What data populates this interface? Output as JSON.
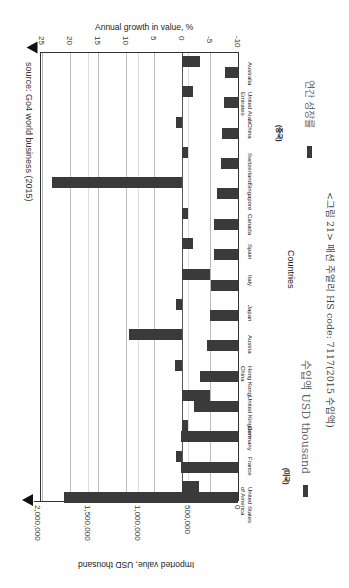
{
  "chart_data": {
    "type": "bar",
    "orientation": "rotated-90-clockwise",
    "source": "source: Go4 world business (2015)",
    "caption": "<그림 21> 패션 주얼리 HS code: 7117(2015 수입액)",
    "categories": [
      "Australia",
      "United Arab Emirates",
      "China",
      "Switzerland",
      "Singapore",
      "Canada",
      "Spain",
      "Italy",
      "Japan",
      "Austria",
      "Hong Kong, China",
      "United Kingdom",
      "Germany",
      "France",
      "United States of America"
    ],
    "category_labels": [
      "Australia",
      "United Arab\nEmirates",
      "China",
      "Switzerland",
      "Singapore",
      "Canada",
      "Spain",
      "Italy",
      "Japan",
      "Austria",
      "Hong Kong,\nChina",
      "United Kingdom",
      "Germany",
      "France",
      "United States\nof America"
    ],
    "annotations": [
      {
        "category": "China",
        "text": "(중국)"
      },
      {
        "category": "United States of America",
        "text": "(미국)"
      }
    ],
    "xlabel": "Countries",
    "series": [
      {
        "name": "연간 성장률",
        "axis": "Annual growth in value, %",
        "values": [
          -3.2,
          -2,
          1,
          -1,
          23.2,
          -1,
          -2,
          -5,
          1,
          9.5,
          1.2,
          -5,
          -1,
          1,
          -3
        ],
        "ylim": [
          -10,
          25
        ],
        "ticks": [
          "25",
          "20",
          "15",
          "10",
          "5",
          "0",
          "-5",
          "-10"
        ]
      },
      {
        "name": "수입액 USD thousand",
        "axis": "Imported value, USD thousand",
        "values": [
          130000,
          140000,
          160000,
          170000,
          210000,
          240000,
          240000,
          270000,
          280000,
          310000,
          380000,
          440000,
          570000,
          570000,
          1740000
        ],
        "ylim": [
          0,
          2000000
        ],
        "ticks": [
          "2,000,000",
          "1,500,000",
          "1,000,000",
          "500,000",
          "0"
        ]
      }
    ],
    "legend": [
      {
        "label": "연간 성장률",
        "color": "#3a3a3a"
      },
      {
        "label": "수입액 USD thousand",
        "color": "#3a3a3a"
      }
    ],
    "grid": true
  },
  "labels": {
    "top_axis_title": "Annual growth in value, %",
    "bottom_axis_title": "Imported value, USD thousand",
    "countries_title": "Countries",
    "source": "source: Go4 world business (2015)",
    "legend_growth": "연간 성장률",
    "legend_import": "수입액 USD thousand",
    "caption": "<그림 21> 패션 주얼리 HS code: 7117(2015 수입액)",
    "china_note": "(중국)",
    "usa_note": "(미국)"
  }
}
